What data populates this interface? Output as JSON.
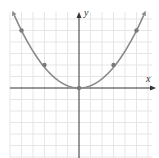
{
  "chart_data": {
    "type": "line",
    "title": "",
    "xlabel": "x",
    "ylabel": "y",
    "xlim": [
      -6,
      6
    ],
    "ylim": [
      -6,
      7
    ],
    "grid": true,
    "grid_step": 1,
    "tick_labels": false,
    "series": [
      {
        "name": "parabola",
        "equation": "y = x^2 / 5",
        "color": "#8a8a8a",
        "curve": "quadratic",
        "arrows_at_ends": true,
        "marked_points": [
          {
            "x": -5,
            "y": 5
          },
          {
            "x": -3,
            "y": 2
          },
          {
            "x": 0,
            "y": 0
          },
          {
            "x": 3,
            "y": 2
          },
          {
            "x": 5,
            "y": 5
          }
        ]
      }
    ]
  },
  "colors": {
    "grid": "#e6e6e6",
    "axis": "#333333",
    "curve": "#8a8a8a",
    "point": "#7a7a7a",
    "background": "#ffffff"
  },
  "geometry": {
    "origin_px": [
      79,
      88
    ],
    "unit_px": 11.5,
    "x_axis_start_px": 10,
    "x_axis_end_px": 156,
    "y_axis_top_px": 12,
    "y_axis_bottom_px": 158
  }
}
